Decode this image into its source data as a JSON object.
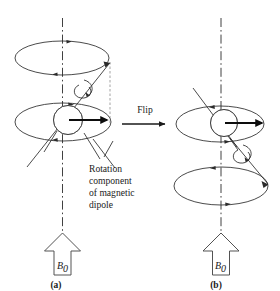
{
  "figure": {
    "background_color": "#ffffff",
    "line_color": "#2b2b2b",
    "dash_color": "#7d7d7d",
    "dipole_arrow_color": "#0d0d0d"
  },
  "panels": [
    {
      "id": "a",
      "caption": "(a)",
      "field_label": "B",
      "field_subscript": "0",
      "sphere_position": "lower-cone",
      "dipole_direction": "right",
      "cones": [
        {
          "role": "upper-precession-cone",
          "center_x": 62,
          "center_y": 58,
          "rx": 47,
          "ry": 17
        },
        {
          "role": "lower-precession-cone",
          "center_x": 63,
          "center_y": 122,
          "rx": 48,
          "ry": 19
        }
      ]
    },
    {
      "id": "b",
      "caption": "(b)",
      "field_label": "B",
      "field_subscript": "0",
      "sphere_position": "upper-cone",
      "dipole_direction": "right",
      "cones": [
        {
          "role": "upper-precession-cone",
          "center_x": 220,
          "center_y": 124,
          "rx": 44,
          "ry": 18
        },
        {
          "role": "lower-precession-cone",
          "center_x": 221,
          "center_y": 186,
          "rx": 47,
          "ry": 19
        }
      ]
    }
  ],
  "transition": {
    "label": "Flip",
    "arrow": "right-arrow"
  },
  "annotation": {
    "lines": [
      "Rotation",
      "component",
      "of magnetic",
      "dipole"
    ],
    "full_text": "Rotation component of magnetic dipole",
    "leader_lines": 2
  },
  "captions": {
    "panel_a": "(a)",
    "panel_b": "(b)"
  },
  "field_arrows": [
    {
      "panel": "a",
      "label": "B",
      "subscript": "0",
      "style": "hollow-block-arrow-up"
    },
    {
      "panel": "b",
      "label": "B",
      "subscript": "0",
      "style": "hollow-block-arrow-up"
    }
  ]
}
